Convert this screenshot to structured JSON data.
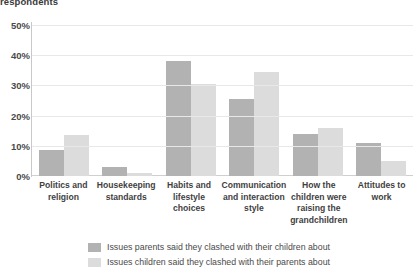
{
  "top_title": "respondents",
  "legend": {
    "position": "bottom",
    "entries": [
      {
        "name": "parents",
        "label": "Issues parents said they clashed with their children about",
        "color": "#b2b2b2"
      },
      {
        "name": "children",
        "label": "Issues children said they clashed with their parents about",
        "color": "#dcdcdc"
      }
    ]
  },
  "axis": {
    "y_ticks": [
      "0%",
      "10%",
      "20%",
      "30%",
      "40%",
      "50%"
    ]
  },
  "chart_data": {
    "type": "bar",
    "title": "respondents",
    "xlabel": "",
    "ylabel": "",
    "ylim": [
      0,
      50
    ],
    "ytick_values": [
      0,
      10,
      20,
      30,
      40,
      50
    ],
    "ytick_labels": [
      "0%",
      "10%",
      "20%",
      "30%",
      "40%",
      "50%"
    ],
    "grid": true,
    "legend_position": "bottom",
    "categories": [
      "Politics and religion",
      "Housekeeping standards",
      "Habits and lifestyle choices",
      "Communication and interaction style",
      "How the children were raising the grandchildren",
      "Attitudes to work"
    ],
    "series": [
      {
        "name": "Issues parents said they clashed with their children about",
        "color": "#b2b2b2",
        "values": [
          8.5,
          3,
          38,
          25.5,
          14,
          11
        ]
      },
      {
        "name": "Issues children said they clashed with their parents about",
        "color": "#dcdcdc",
        "values": [
          13.5,
          1,
          30.5,
          34.5,
          16,
          5
        ]
      }
    ]
  }
}
